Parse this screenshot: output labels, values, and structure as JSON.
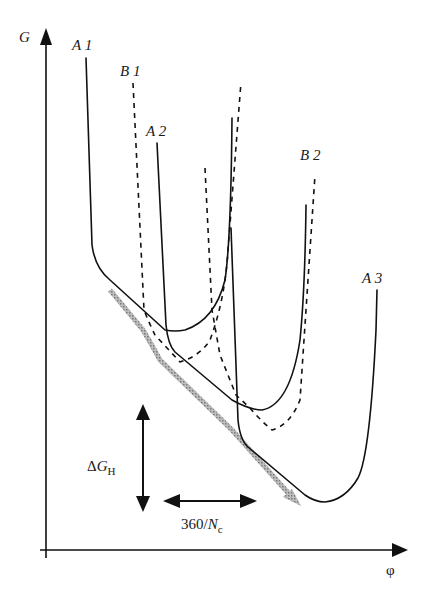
{
  "diagram": {
    "axes": {
      "y_label": "G",
      "x_label": "φ"
    },
    "curves": [
      {
        "id": "A1",
        "label": "A 1",
        "style": "solid"
      },
      {
        "id": "B1",
        "label": "B 1",
        "style": "dashed"
      },
      {
        "id": "A2",
        "label": "A 2",
        "style": "solid"
      },
      {
        "id": "B2",
        "label": "B 2",
        "style": "dashed"
      },
      {
        "id": "A3",
        "label": "A 3",
        "style": "solid"
      }
    ],
    "annotations": {
      "delta_g": {
        "symbol": "Δ",
        "var": "G",
        "sub": "H"
      },
      "period": {
        "text": "360/",
        "var": "N",
        "sub": "c"
      }
    },
    "envelope_arrow_color": "#9a9a9a"
  }
}
